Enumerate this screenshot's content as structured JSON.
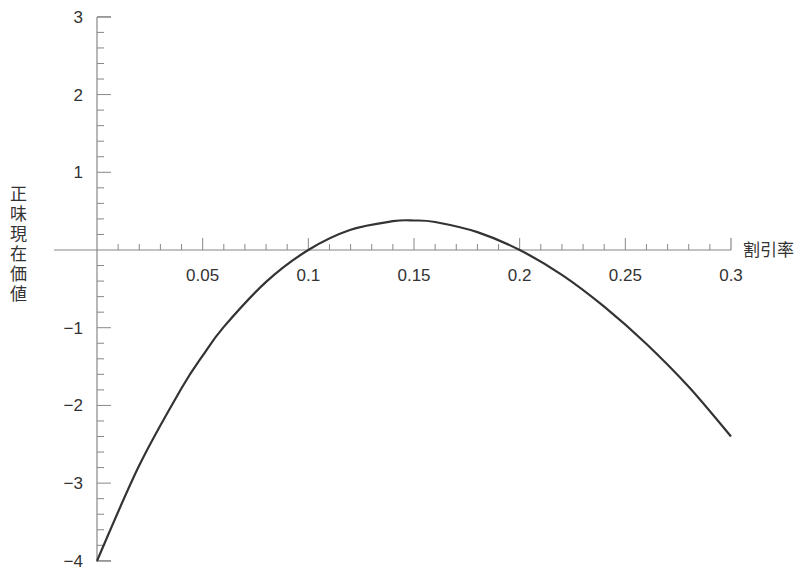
{
  "title_fragment": "",
  "chart_data": {
    "type": "line",
    "title": "",
    "xlabel": "割引率",
    "ylabel": "正味現在価値",
    "xlim": [
      0,
      0.3
    ],
    "ylim": [
      -4,
      3
    ],
    "grid": false,
    "legend": null,
    "x_ticks": [
      {
        "value": 0.05,
        "label": "0.05"
      },
      {
        "value": 0.1,
        "label": "0.1"
      },
      {
        "value": 0.15,
        "label": "0.15"
      },
      {
        "value": 0.2,
        "label": "0.2"
      },
      {
        "value": 0.25,
        "label": "0.25"
      },
      {
        "value": 0.3,
        "label": "0.3"
      }
    ],
    "x_minor_step": 0.01,
    "y_ticks": [
      {
        "value": 3,
        "label": "3"
      },
      {
        "value": 2,
        "label": "2"
      },
      {
        "value": 1,
        "label": "1"
      },
      {
        "value": -1,
        "label": "−1"
      },
      {
        "value": -2,
        "label": "−2"
      },
      {
        "value": -3,
        "label": "−3"
      },
      {
        "value": -4,
        "label": "−4"
      }
    ],
    "y_minor_step": 0.2,
    "series": [
      {
        "name": "NPV",
        "color": "#333333",
        "x": [
          0,
          0.02,
          0.04,
          0.05,
          0.06,
          0.08,
          0.1,
          0.12,
          0.14,
          0.15,
          0.16,
          0.18,
          0.2,
          0.22,
          0.24,
          0.26,
          0.28,
          0.3
        ],
        "y": [
          -4.0,
          -2.77,
          -1.78,
          -1.36,
          -0.99,
          -0.41,
          0.0,
          0.26,
          0.37,
          0.38,
          0.36,
          0.23,
          0.0,
          -0.32,
          -0.73,
          -1.21,
          -1.76,
          -2.4
        ]
      }
    ]
  }
}
